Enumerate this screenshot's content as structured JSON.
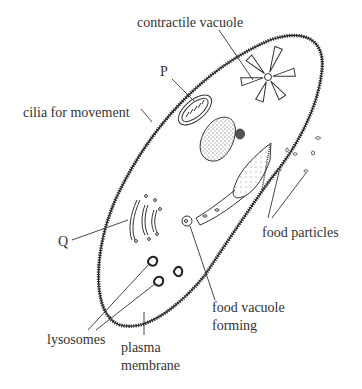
{
  "diagram": {
    "labels": {
      "contractile_vacuole": "contractile vacuole",
      "P": "P",
      "cilia": "cilia for movement",
      "Q": "Q",
      "food_particles": "food particles",
      "food_vacuole_line1": "food vacuole",
      "food_vacuole_line2": "forming",
      "lysosomes": "lysosomes",
      "plasma_line1": "plasma",
      "plasma_line2": "membrane"
    },
    "colors": {
      "ink": "#333333",
      "background": "#ffffff"
    }
  }
}
